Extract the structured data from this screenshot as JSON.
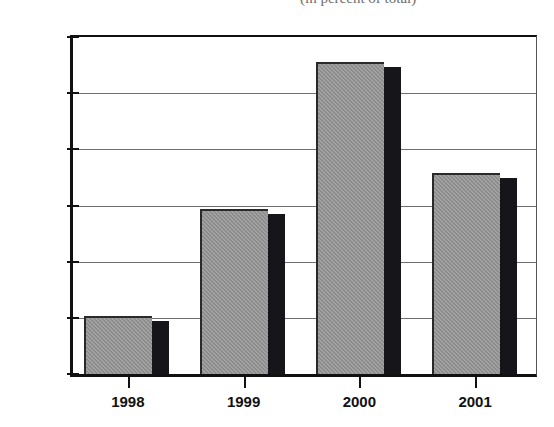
{
  "chart_data": {
    "type": "bar",
    "title": "(in percent of total)",
    "title_truncated": true,
    "xlabel": "",
    "ylabel": "",
    "categories": [
      "1998",
      "1999",
      "2000",
      "2001"
    ],
    "values": [
      205,
      588,
      1112,
      715
    ],
    "series": [
      {
        "name": "",
        "values": [
          205,
          588,
          1112,
          715
        ]
      }
    ],
    "ylim": [
      0,
      1200
    ],
    "yticks": [
      0,
      200,
      400,
      600,
      800,
      1000,
      1200
    ],
    "ytick_labels": [
      "0",
      "200",
      "400",
      "600",
      "800",
      "1,000",
      "1,200"
    ],
    "grid": true,
    "grid_axis": "y",
    "legend": false,
    "legend_position": "none",
    "bar_style": "3d-shaded",
    "colors": {
      "bar_face": "#8c8c8c",
      "bar_side": "#16161a",
      "bar_outline": "#2a2a2a",
      "gridline": "#6f6f6f",
      "axis": "#111111",
      "background": "#ffffff",
      "text": "#1a1a1a"
    }
  }
}
